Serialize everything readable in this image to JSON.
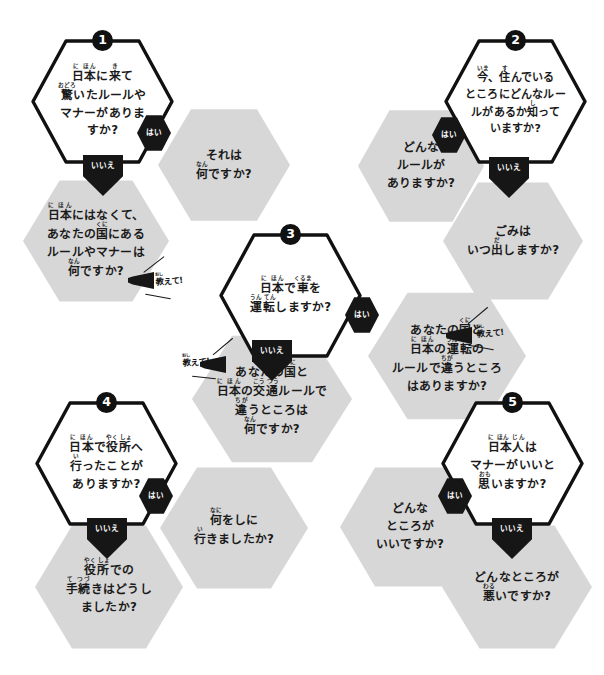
{
  "document": {
    "kind": "worksheet",
    "language": "ja",
    "title": "",
    "background_color": "#ffffff",
    "answer_box_color": "#d7d7d7",
    "connector_color": "#161616",
    "text_color": "#1a1a1a"
  },
  "labels": {
    "yes": "はい",
    "no": "いいえ",
    "tell_me": "教えて!",
    "tell_me_base": "教",
    "tell_me_ruby": "おし",
    "tell_me_tail": "えて!"
  },
  "nodes": [
    {
      "id": 1,
      "number": "1",
      "question": "日本に来て驚いたルールやマナーがありますか?",
      "yes_answer": "それは何ですか?",
      "no_answer": "日本にはなくて、あなたの国にあるルールやマナーは何ですか?",
      "yes_label": "はい",
      "no_label": "いいえ",
      "tell_me_on": "no"
    },
    {
      "id": 2,
      "number": "2",
      "question": "今、住んでいるところにどんなルールがあるか知っていますか?",
      "yes_answer": "どんなルールがありますか?",
      "no_answer": "ごみはいつ出しますか?",
      "yes_label": "はい",
      "no_label": "いいえ",
      "tell_me_on": "none"
    },
    {
      "id": 3,
      "number": "3",
      "question": "日本で車を運転しますか?",
      "yes_answer": "あなたの国と日本の運転のルールで違うところはありますか?",
      "no_answer": "あなたの国と日本の交通ルールで違うところは何ですか?",
      "yes_label": "はい",
      "no_label": "いいえ",
      "tell_me_on": "both"
    },
    {
      "id": 4,
      "number": "4",
      "question": "日本で役所へ行ったことがありますか?",
      "yes_answer": "何をしに行きましたか?",
      "no_answer": "役所での手続きはどうしましたか?",
      "yes_label": "はい",
      "no_label": "いいえ",
      "tell_me_on": "none"
    },
    {
      "id": 5,
      "number": "5",
      "question": "日本人はマナーがいいと思いますか?",
      "yes_answer": "どんなところがいいですか?",
      "no_answer": "どんなところが悪いですか?",
      "yes_label": "はい",
      "no_label": "いいえ",
      "tell_me_on": "none"
    }
  ]
}
